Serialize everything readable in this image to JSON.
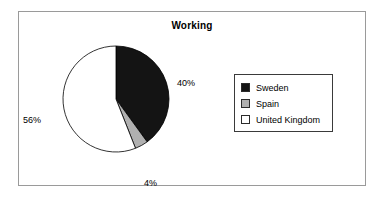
{
  "chart_data": {
    "type": "pie",
    "title": "Working",
    "categories": [
      "Sweden",
      "Spain",
      "United Kingdom"
    ],
    "values": [
      40,
      4,
      56
    ],
    "value_labels": [
      "40%",
      "4%",
      "56%"
    ],
    "colors": [
      "#141414",
      "#b0b0b0",
      "#ffffff"
    ],
    "slice_outline_color": "#000000",
    "start_angle_deg": 0,
    "direction": "clockwise",
    "legend": {
      "position": "right",
      "entries": [
        {
          "label": "Sweden",
          "color": "#141414"
        },
        {
          "label": "Spain",
          "color": "#b0b0b0"
        },
        {
          "label": "United Kingdom",
          "color": "#ffffff"
        }
      ]
    },
    "xlabel": "",
    "ylabel": "",
    "grid": false
  },
  "frame": {
    "border_color": "#9a9a9a"
  }
}
